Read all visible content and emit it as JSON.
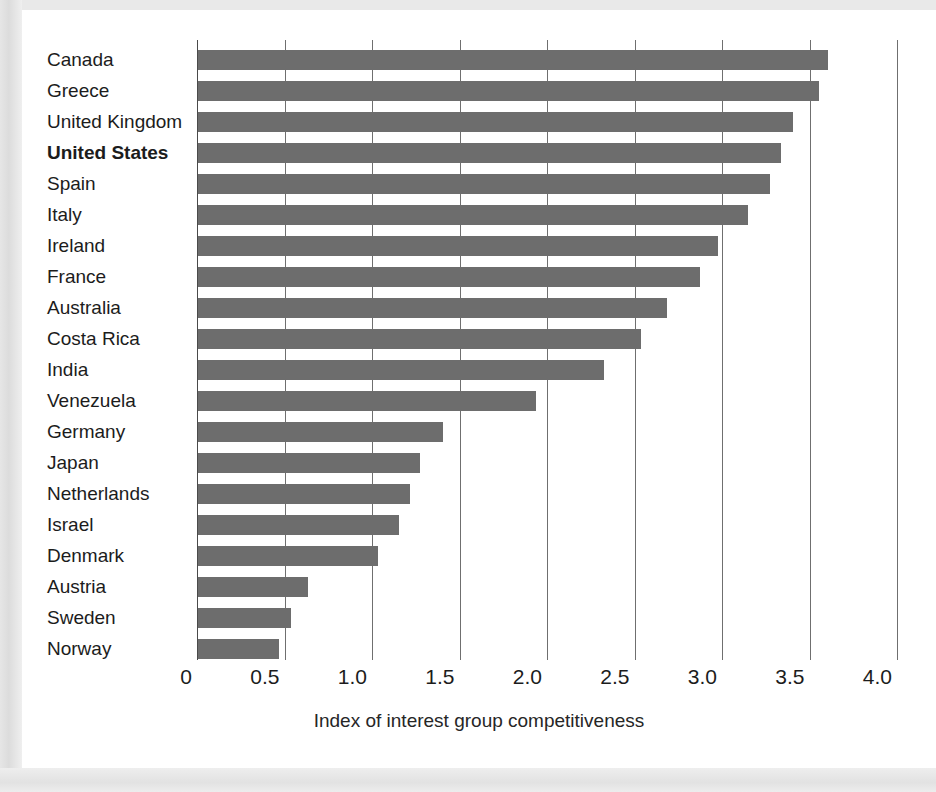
{
  "chart_data": {
    "type": "bar",
    "orientation": "horizontal",
    "title": "",
    "xlabel": "Index of interest group competitiveness",
    "ylabel": "",
    "xlim": [
      0,
      4.0
    ],
    "xticks": [
      "0",
      "0.5",
      "1.0",
      "1.5",
      "2.0",
      "2.5",
      "3.0",
      "3.5",
      "4.0"
    ],
    "xtick_values": [
      0,
      0.5,
      1.0,
      1.5,
      2.0,
      2.5,
      3.0,
      3.5,
      4.0
    ],
    "grid": "vertical-gridlines-at-ticks",
    "legend": "none",
    "bar_color": "#6d6d6d",
    "highlight_category": "United States",
    "categories": [
      "Canada",
      "Greece",
      "United Kingdom",
      "United States",
      "Spain",
      "Italy",
      "Ireland",
      "France",
      "Australia",
      "Costa Rica",
      "India",
      "Venezuela",
      "Germany",
      "Japan",
      "Netherlands",
      "Israel",
      "Denmark",
      "Austria",
      "Sweden",
      "Norway"
    ],
    "values": [
      3.6,
      3.55,
      3.4,
      3.33,
      3.27,
      3.14,
      2.97,
      2.87,
      2.68,
      2.53,
      2.32,
      1.93,
      1.4,
      1.27,
      1.21,
      1.15,
      1.03,
      0.63,
      0.53,
      0.46
    ]
  }
}
